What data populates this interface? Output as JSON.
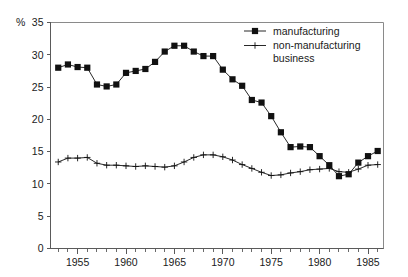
{
  "chart_data": {
    "type": "line",
    "title": "",
    "xlabel": "",
    "ylabel": "",
    "yunit": "%",
    "xlim": [
      1952.2,
      1986.6
    ],
    "ylim": [
      0,
      35
    ],
    "grid": false,
    "legend_position": "top-right",
    "ytick_labels": [
      "0",
      "5",
      "10",
      "15",
      "20",
      "25",
      "30",
      "35"
    ],
    "ytick_values": [
      0,
      5,
      10,
      15,
      20,
      25,
      30,
      35
    ],
    "xtick_labels": [
      "1955",
      "1960",
      "1965",
      "1970",
      "1975",
      "1980",
      "1985"
    ],
    "xtick_values": [
      1955,
      1960,
      1965,
      1970,
      1975,
      1980,
      1985
    ],
    "x": [
      1953,
      1954,
      1955,
      1956,
      1957,
      1958,
      1959,
      1960,
      1961,
      1962,
      1963,
      1964,
      1965,
      1966,
      1967,
      1968,
      1969,
      1970,
      1971,
      1972,
      1973,
      1974,
      1975,
      1976,
      1977,
      1978,
      1979,
      1980,
      1981,
      1982,
      1983,
      1984,
      1985,
      1986
    ],
    "series": [
      {
        "name": "manufacturing",
        "marker": "filled-square",
        "values": [
          28.0,
          28.5,
          28.1,
          28.0,
          25.4,
          25.1,
          25.4,
          27.2,
          27.5,
          27.8,
          28.9,
          30.5,
          31.4,
          31.4,
          30.5,
          29.8,
          29.8,
          27.7,
          26.2,
          25.2,
          23.0,
          22.6,
          20.5,
          18.0,
          15.7,
          15.8,
          15.7,
          14.3,
          12.9,
          11.2,
          11.5,
          13.3,
          14.3,
          15.1
        ]
      },
      {
        "name": "non-manufacturing business",
        "marker": "plus",
        "values": [
          13.4,
          14.0,
          14.0,
          14.1,
          13.2,
          12.9,
          12.9,
          12.8,
          12.7,
          12.8,
          12.7,
          12.6,
          12.8,
          13.4,
          14.1,
          14.5,
          14.5,
          14.2,
          13.7,
          13.0,
          12.4,
          11.8,
          11.3,
          11.4,
          11.7,
          11.9,
          12.2,
          12.3,
          12.4,
          11.9,
          11.8,
          12.3,
          12.9,
          13.0
        ]
      }
    ]
  },
  "legend": {
    "items": [
      {
        "label": "manufacturing",
        "marker": "filled-square"
      },
      {
        "label": "non-manufacturing",
        "label2": "business",
        "marker": "plus"
      }
    ]
  }
}
